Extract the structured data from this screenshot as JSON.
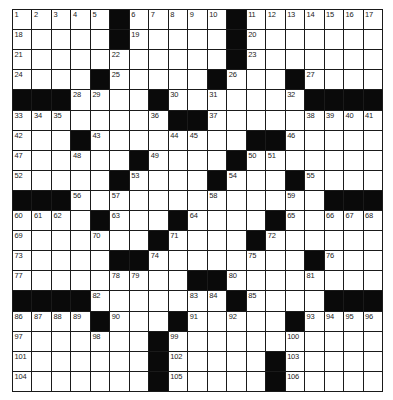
{
  "puzzle": {
    "rows": 19,
    "cols": 19,
    "colors": {
      "block": "#0a0a0a",
      "cell": "#ffffff",
      "grid_line": "#1a1a1a",
      "number_text": "#222222"
    },
    "legend": "# = black square, 0 = empty white square, N = white square with clue number N",
    "grid": [
      [
        1,
        2,
        3,
        4,
        5,
        "#",
        6,
        7,
        8,
        9,
        10,
        "#",
        11,
        12,
        13,
        14,
        15,
        16,
        17
      ],
      [
        18,
        0,
        0,
        0,
        0,
        "#",
        19,
        0,
        0,
        0,
        0,
        "#",
        20,
        0,
        0,
        0,
        0,
        0,
        0
      ],
      [
        21,
        0,
        0,
        0,
        0,
        22,
        0,
        0,
        0,
        0,
        0,
        "#",
        23,
        0,
        0,
        0,
        0,
        0,
        0
      ],
      [
        24,
        0,
        0,
        0,
        "#",
        25,
        0,
        0,
        0,
        0,
        "#",
        26,
        0,
        0,
        "#",
        27,
        0,
        0,
        0
      ],
      [
        "#",
        "#",
        "#",
        28,
        29,
        0,
        0,
        "#",
        30,
        0,
        31,
        0,
        0,
        0,
        32,
        "#",
        "#",
        "#",
        "#"
      ],
      [
        33,
        34,
        35,
        0,
        0,
        0,
        0,
        36,
        "#",
        "#",
        37,
        0,
        0,
        0,
        0,
        38,
        39,
        40,
        41
      ],
      [
        42,
        0,
        0,
        "#",
        43,
        0,
        0,
        0,
        44,
        45,
        0,
        0,
        "#",
        "#",
        46,
        0,
        0,
        0,
        0
      ],
      [
        47,
        0,
        0,
        48,
        0,
        0,
        "#",
        49,
        0,
        0,
        0,
        "#",
        50,
        51,
        0,
        0,
        0,
        0,
        0
      ],
      [
        52,
        0,
        0,
        0,
        0,
        "#",
        53,
        0,
        0,
        0,
        "#",
        54,
        0,
        0,
        "#",
        55,
        0,
        0,
        0
      ],
      [
        "#",
        "#",
        "#",
        56,
        0,
        57,
        0,
        0,
        0,
        0,
        58,
        0,
        0,
        0,
        59,
        0,
        "#",
        "#",
        "#"
      ],
      [
        60,
        61,
        62,
        0,
        "#",
        63,
        0,
        0,
        "#",
        64,
        0,
        0,
        0,
        "#",
        65,
        0,
        66,
        67,
        68
      ],
      [
        69,
        0,
        0,
        0,
        70,
        0,
        0,
        "#",
        71,
        0,
        0,
        0,
        "#",
        72,
        0,
        0,
        0,
        0,
        0
      ],
      [
        73,
        0,
        0,
        0,
        0,
        "#",
        "#",
        74,
        0,
        0,
        0,
        0,
        75,
        0,
        0,
        "#",
        76,
        0,
        0
      ],
      [
        77,
        0,
        0,
        0,
        0,
        78,
        79,
        0,
        0,
        "#",
        "#",
        80,
        0,
        0,
        0,
        81,
        0,
        0,
        0
      ],
      [
        "#",
        "#",
        "#",
        "#",
        82,
        0,
        0,
        0,
        0,
        83,
        84,
        "#",
        85,
        0,
        0,
        0,
        "#",
        "#",
        "#"
      ],
      [
        86,
        87,
        88,
        89,
        "#",
        90,
        0,
        0,
        "#",
        91,
        0,
        92,
        0,
        0,
        "#",
        93,
        94,
        95,
        96
      ],
      [
        97,
        0,
        0,
        0,
        98,
        0,
        0,
        "#",
        99,
        0,
        0,
        0,
        0,
        0,
        100,
        0,
        0,
        0,
        0
      ],
      [
        101,
        0,
        0,
        0,
        0,
        0,
        0,
        "#",
        102,
        0,
        0,
        0,
        0,
        "#",
        103,
        0,
        0,
        0,
        0
      ],
      [
        104,
        0,
        0,
        0,
        0,
        0,
        0,
        "#",
        105,
        0,
        0,
        0,
        0,
        "#",
        106,
        0,
        0,
        0,
        0
      ]
    ]
  }
}
